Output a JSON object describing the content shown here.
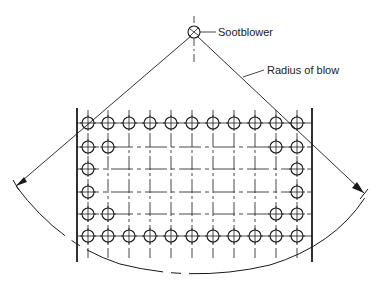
{
  "diagram": {
    "type": "sootblower-coverage",
    "labels": {
      "sootblower": "Sootblower",
      "radius": "Radius of blow"
    },
    "sootblower": {
      "x": 194,
      "y": 32,
      "r": 6
    },
    "walls": {
      "left_x": 77,
      "right_x": 312,
      "top_y": 108,
      "bottom_y": 262
    },
    "tube_columns_x": [
      88,
      108,
      129,
      150,
      171,
      192,
      213,
      234,
      255,
      276,
      297
    ],
    "tube_rows_y": [
      123,
      147,
      169,
      192,
      214,
      236
    ],
    "tubes_present": [
      [
        1,
        1,
        1,
        1,
        1,
        1,
        1,
        1,
        1,
        1,
        1
      ],
      [
        1,
        1,
        0,
        0,
        0,
        0,
        0,
        0,
        0,
        1,
        1
      ],
      [
        1,
        0,
        0,
        0,
        0,
        0,
        0,
        0,
        0,
        0,
        1
      ],
      [
        1,
        0,
        0,
        0,
        0,
        0,
        0,
        0,
        0,
        0,
        1
      ],
      [
        1,
        1,
        0,
        0,
        0,
        0,
        0,
        0,
        0,
        1,
        1
      ],
      [
        1,
        1,
        1,
        1,
        1,
        1,
        1,
        1,
        1,
        1,
        1
      ]
    ],
    "tube_radius": 6,
    "colors": {
      "line": "#1a1a1a",
      "background": "#ffffff"
    }
  }
}
